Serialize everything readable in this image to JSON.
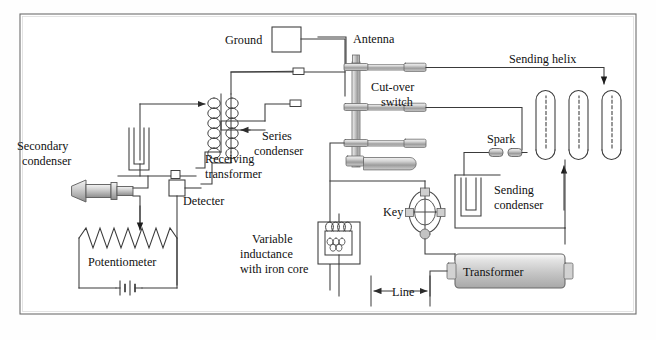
{
  "figure": {
    "kind": "schematic-diagram",
    "frame_color": "#555555",
    "wire_color": "#3a3a3a",
    "metal_fill": "#b9b9b9",
    "background": "#fefefe"
  },
  "labels": {
    "ground": "Ground",
    "antenna": "Antenna",
    "sending_helix": "Sending helix",
    "cut_over_switch": "Cut-over\nswitch",
    "cut_over_switch_line1": "Cut-over",
    "cut_over_switch_line2": "switch",
    "spark": "Spark",
    "series_condenser_line1": "Series",
    "series_condenser_line2": "condenser",
    "secondary_condenser_line1": "Secondary",
    "secondary_condenser_line2": "condenser",
    "receiving_transformer_line1": "Receiving",
    "receiving_transformer_line2": "transformer",
    "detecter": "Detecter",
    "potentiometer": "Potentiometer",
    "variable_inductance_line1": "Variable",
    "variable_inductance_line2": "inductance",
    "variable_inductance_line3": "with iron core",
    "key": "Key",
    "sending_condenser_line1": "Sending",
    "sending_condenser_line2": "condenser",
    "transformer": "Transformer",
    "line": "Line"
  },
  "components": [
    {
      "id": "ground-box",
      "name": "Ground",
      "shape": "square-terminal"
    },
    {
      "id": "antenna-lead",
      "name": "Antenna",
      "shape": "vertical-wire"
    },
    {
      "id": "cut-over-switch",
      "name": "Cut-over switch",
      "shape": "knife-switch-stack",
      "contacts": 3
    },
    {
      "id": "sending-helix",
      "name": "Sending helix",
      "shape": "serpentine-coil",
      "turns": 4
    },
    {
      "id": "spark-gap",
      "name": "Spark",
      "shape": "two-electrode-gap"
    },
    {
      "id": "series-condenser",
      "name": "Series condenser",
      "shape": "terminal-pair"
    },
    {
      "id": "secondary-condenser",
      "name": "Secondary condenser",
      "shape": "u-capacitor"
    },
    {
      "id": "receiving-transformer",
      "name": "Receiving transformer",
      "shape": "dual-coil",
      "primary_turns": 6,
      "secondary_turns": 6
    },
    {
      "id": "detecter",
      "name": "Detecter",
      "shape": "square-box"
    },
    {
      "id": "earphone",
      "name": "Earphone",
      "shape": "horn"
    },
    {
      "id": "potentiometer",
      "name": "Potentiometer",
      "shape": "zigzag-resistor-with-wiper",
      "zigzags": 7
    },
    {
      "id": "battery",
      "name": "Battery",
      "shape": "cell-pair"
    },
    {
      "id": "variable-inductance",
      "name": "Variable inductance with iron core",
      "shape": "boxed-coil"
    },
    {
      "id": "key",
      "name": "Key",
      "shape": "ellipse-cross"
    },
    {
      "id": "sending-condenser",
      "name": "Sending condenser",
      "shape": "u-capacitor"
    },
    {
      "id": "transformer",
      "name": "Transformer",
      "shape": "cylinder-body"
    },
    {
      "id": "line",
      "name": "Line",
      "shape": "double-arrow-dimension"
    }
  ]
}
